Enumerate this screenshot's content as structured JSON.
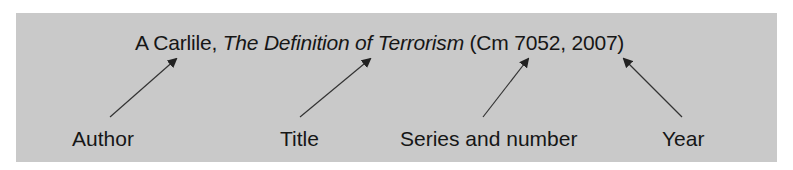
{
  "diagram": {
    "citation": {
      "author": "A Carlile,",
      "title": "The Definition of Terrorism",
      "series_open": "(Cm 7052,",
      "year": "2007)"
    },
    "labels": [
      {
        "id": "author",
        "text": "Author"
      },
      {
        "id": "title",
        "text": "Title"
      },
      {
        "id": "series",
        "text": "Series and number"
      },
      {
        "id": "year",
        "text": "Year"
      }
    ],
    "colors": {
      "background": "#c9c9c9",
      "text": "#161616",
      "arrow": "#333333"
    }
  }
}
